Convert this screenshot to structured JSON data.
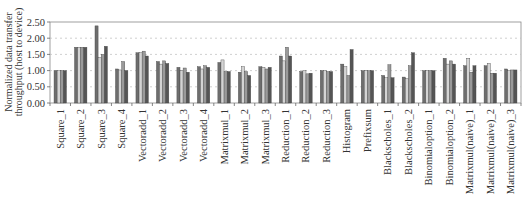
{
  "chart_data": {
    "type": "bar",
    "title": "",
    "xlabel": "",
    "ylabel": "Normalized data transfer throughput (host to device)",
    "ylabel_lines": [
      "Normalized data transfer",
      "throughput (host to device)"
    ],
    "ylim": [
      0,
      2.5
    ],
    "yticks": [
      "0.00",
      "0.50",
      "1.00",
      "1.50",
      "2.00",
      "2.50"
    ],
    "grid": "horizontal dashed",
    "legend": "none",
    "categories": [
      "Square_1",
      "Square_2",
      "Square_3",
      "Square_4",
      "Vectoradd_1",
      "Vectoradd_2",
      "Vectoradd_3",
      "Vectoradd_4",
      "Matrixmul_1",
      "Matrixmul_2",
      "Matrixmul_3",
      "Reduction_1",
      "Reduction_2",
      "Reduction_3",
      "Histogram",
      "Prefixsum",
      "Blackscholes_1",
      "Blackscholes_2",
      "Binomialoption_1",
      "Binomialoption_2",
      "Matrixmul(naive)_1",
      "Matrixmul(naive)_2",
      "Matrixmul(naive)_3"
    ],
    "series": [
      {
        "name": "Series 1",
        "color": "#6e6e6e",
        "values": [
          1.0,
          1.72,
          2.38,
          1.05,
          1.55,
          1.28,
          1.1,
          1.12,
          1.25,
          0.95,
          1.12,
          1.45,
          0.97,
          1.0,
          1.2,
          1.0,
          0.85,
          0.8,
          1.0,
          1.38,
          1.15,
          1.15,
          1.05
        ]
      },
      {
        "name": "Series 2",
        "color": "#d4d4d4",
        "values": [
          1.0,
          1.72,
          1.4,
          1.02,
          1.55,
          1.2,
          1.0,
          1.05,
          1.33,
          1.12,
          1.1,
          1.3,
          1.0,
          1.0,
          1.12,
          1.0,
          0.78,
          0.75,
          1.0,
          1.2,
          1.38,
          1.22,
          1.0
        ]
      },
      {
        "name": "Series 3",
        "color": "#9a9a9a",
        "values": [
          1.0,
          1.72,
          1.5,
          1.28,
          1.6,
          1.3,
          1.08,
          1.15,
          0.97,
          0.97,
          1.05,
          1.72,
          0.9,
          0.97,
          0.85,
          1.0,
          1.18,
          1.15,
          1.0,
          1.3,
          0.95,
          0.92,
          1.02
        ]
      },
      {
        "name": "Series 4",
        "color": "#555555",
        "values": [
          1.0,
          1.72,
          1.75,
          1.0,
          1.45,
          1.22,
          0.95,
          1.1,
          0.97,
          0.85,
          1.1,
          1.45,
          0.92,
          0.97,
          1.65,
          1.0,
          0.78,
          1.55,
          1.0,
          1.2,
          1.15,
          0.92,
          1.02
        ]
      }
    ]
  }
}
